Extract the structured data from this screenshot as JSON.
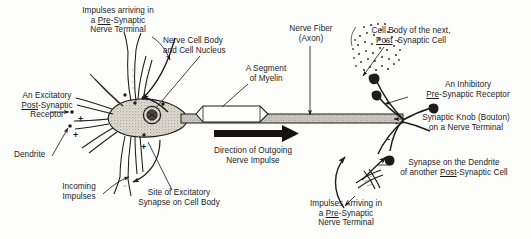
{
  "figure": {
    "background_color": "#fdfdfc",
    "ink_color": "#1c1c1c",
    "soma_fill": "#d8d4cc"
  },
  "labels": {
    "impulses_pre_left": {
      "lines": [
        "Impulses arriving in",
        "a Pre-Synaptic",
        "Nerve Terminal"
      ],
      "underline": "Pre"
    },
    "nerve_cell_body": {
      "lines": [
        "Nerve Cell Body",
        "and Cell Nucleus"
      ]
    },
    "segment_myelin": {
      "lines": [
        "A Segment",
        "of Myelin"
      ]
    },
    "nerve_fiber": {
      "lines": [
        "Nerve Fiber",
        "(Axon)"
      ]
    },
    "cell_body_next": {
      "lines": [
        "Cell Body of the next,",
        "Post -Synaptic Cell"
      ],
      "underline": "Post"
    },
    "excitatory_receptor": {
      "lines": [
        "An Excitatory",
        "Post-Synaptic",
        "Receptor"
      ],
      "underline": "Post"
    },
    "inhibitory_receptor": {
      "lines": [
        "An Inhibitory",
        "Pre-Synaptic Receptor"
      ],
      "underline": "Pre"
    },
    "synaptic_knob": {
      "lines": [
        "Synaptic Knob (Bouton)",
        "on a Nerve Terminal"
      ]
    },
    "dendrite": {
      "lines": [
        "Dendrite"
      ]
    },
    "incoming_impulses": {
      "lines": [
        "Incoming",
        "Impulses"
      ]
    },
    "site_excitatory_synapse": {
      "lines": [
        "Site of Excitatory",
        "Synapse on Cell Body"
      ]
    },
    "direction_impulse": {
      "lines": [
        "Direction of Outgoing",
        "Nerve Impulse"
      ]
    },
    "synapse_dendrite": {
      "lines": [
        "Synapse on the Dendrite",
        "of another Post-Synaptic Cell"
      ],
      "underline": "Post"
    },
    "impulses_pre_right": {
      "lines": [
        "Impulses Arriving in",
        "a Pre-Synaptic",
        "Nerve Terminal"
      ],
      "underline": "Pre"
    }
  },
  "signs": {
    "plus_upper_left": "+",
    "plus_lower_left": "+",
    "plus_soma_bottom": "+",
    "minus_axon_terminal": "-",
    "minus_knob": "-"
  }
}
